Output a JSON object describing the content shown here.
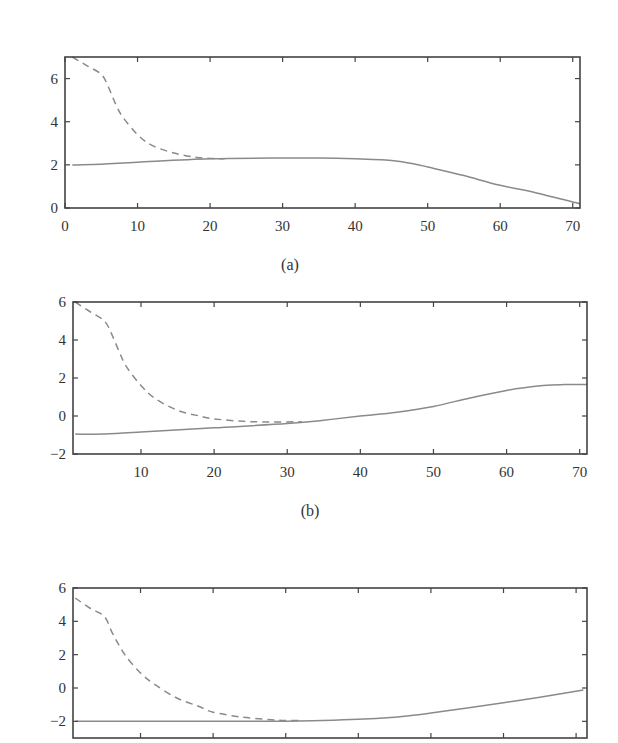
{
  "figure": {
    "line_color": "#8a8a8a",
    "axis_color": "#444444"
  },
  "chart_data": [
    {
      "type": "line",
      "panel": "a",
      "caption": "(a)",
      "box": {
        "left": 65,
        "top": 57,
        "right": 580,
        "bottom": 208
      },
      "xlim": [
        0,
        71
      ],
      "ylim": [
        0,
        7
      ],
      "xticks": [
        0,
        10,
        20,
        30,
        40,
        50,
        60,
        70
      ],
      "xtick_labels": [
        "0",
        "10",
        "20",
        "30",
        "40",
        "50",
        "60",
        "70"
      ],
      "yticks": [
        0,
        2,
        4,
        6
      ],
      "ytick_labels": [
        "0",
        "2",
        "4",
        "6"
      ],
      "show_xtick_labels": true,
      "caption_pos": {
        "x": 290,
        "y": 270
      },
      "title": "",
      "xlabel": "",
      "ylabel": "",
      "grid": false,
      "series": [
        {
          "name": "estimate",
          "style": "dashed",
          "x": [
            1,
            3,
            5,
            6,
            7,
            8,
            10,
            12,
            15,
            18,
            20,
            22
          ],
          "y": [
            7.0,
            6.6,
            6.2,
            5.6,
            4.8,
            4.2,
            3.4,
            2.9,
            2.55,
            2.35,
            2.3,
            2.28
          ]
        },
        {
          "name": "true",
          "style": "solid",
          "x": [
            1,
            5,
            10,
            20,
            30,
            35,
            40,
            45,
            48,
            50,
            55,
            60,
            65,
            71
          ],
          "y": [
            2.0,
            2.03,
            2.12,
            2.28,
            2.32,
            2.32,
            2.28,
            2.2,
            2.05,
            1.9,
            1.5,
            1.05,
            0.7,
            0.2
          ]
        }
      ]
    },
    {
      "type": "line",
      "panel": "b",
      "caption": "(b)",
      "box": {
        "left": 73,
        "top": 302,
        "right": 587,
        "bottom": 454
      },
      "xlim": [
        0.7,
        71
      ],
      "ylim": [
        -2,
        6
      ],
      "xticks": [
        10,
        20,
        30,
        40,
        50,
        60,
        70
      ],
      "xtick_labels": [
        "10",
        "20",
        "30",
        "40",
        "50",
        "60",
        "70"
      ],
      "yticks": [
        -2,
        0,
        2,
        4,
        6
      ],
      "ytick_labels": [
        "−2",
        "0",
        "2",
        "4",
        "6"
      ],
      "show_xtick_labels": true,
      "caption_pos": {
        "x": 310,
        "y": 516
      },
      "title": "",
      "xlabel": "",
      "ylabel": "",
      "grid": false,
      "series": [
        {
          "name": "estimate",
          "style": "dashed",
          "x": [
            1,
            3,
            5,
            6,
            7,
            8,
            10,
            12,
            15,
            18,
            20,
            24,
            28,
            32
          ],
          "y": [
            6.0,
            5.5,
            5.0,
            4.3,
            3.4,
            2.6,
            1.6,
            0.9,
            0.3,
            0.0,
            -0.15,
            -0.28,
            -0.32,
            -0.3
          ]
        },
        {
          "name": "true",
          "style": "solid",
          "x": [
            1,
            5,
            10,
            20,
            30,
            35,
            40,
            45,
            50,
            55,
            60,
            65,
            68,
            71
          ],
          "y": [
            -0.95,
            -0.95,
            -0.85,
            -0.62,
            -0.4,
            -0.22,
            0.0,
            0.2,
            0.5,
            0.95,
            1.35,
            1.6,
            1.65,
            1.65
          ]
        }
      ]
    },
    {
      "type": "line",
      "panel": "c",
      "caption": "",
      "box": {
        "left": 73,
        "top": 588,
        "right": 587,
        "bottom": 738
      },
      "xlim": [
        0.7,
        71.5
      ],
      "ylim": [
        -3,
        6
      ],
      "xticks": [
        10,
        20,
        30,
        40,
        50,
        60,
        70
      ],
      "xtick_labels": [],
      "yticks": [
        -2,
        0,
        2,
        4,
        6
      ],
      "ytick_labels": [
        "−2",
        "0",
        "2",
        "4",
        "6"
      ],
      "show_xtick_labels": false,
      "caption_pos": null,
      "title": "",
      "xlabel": "",
      "ylabel": "",
      "grid": false,
      "series": [
        {
          "name": "estimate",
          "style": "dashed",
          "x": [
            1,
            3,
            5,
            6,
            7,
            8,
            10,
            12,
            15,
            18,
            20,
            24,
            28,
            30,
            32
          ],
          "y": [
            5.4,
            4.8,
            4.3,
            3.4,
            2.6,
            1.9,
            0.9,
            0.2,
            -0.6,
            -1.1,
            -1.45,
            -1.75,
            -1.9,
            -1.95,
            -1.95
          ]
        },
        {
          "name": "true",
          "style": "solid",
          "x": [
            1,
            5,
            10,
            20,
            30,
            35,
            40,
            45,
            48,
            50,
            55,
            60,
            65,
            71
          ],
          "y": [
            -2.0,
            -2.0,
            -2.0,
            -2.0,
            -2.0,
            -1.95,
            -1.88,
            -1.75,
            -1.62,
            -1.5,
            -1.2,
            -0.88,
            -0.55,
            -0.12
          ]
        }
      ]
    }
  ]
}
